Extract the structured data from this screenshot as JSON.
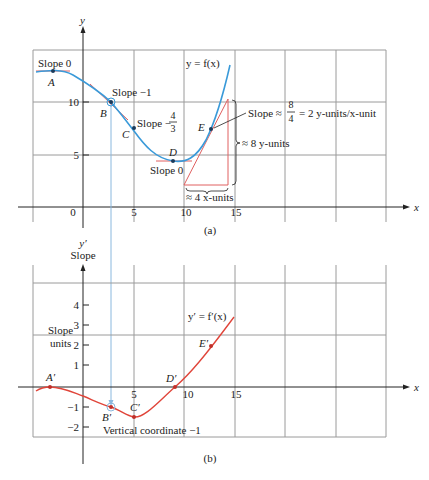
{
  "figure_a": {
    "caption": "(a)",
    "y_axis_label": "y",
    "x_axis_label": "x",
    "curve_label": "y = f(x)",
    "x_ticks": [
      "0",
      "5",
      "10",
      "15"
    ],
    "y_ticks": [
      "10",
      "5"
    ],
    "points": [
      {
        "name": "A",
        "slope_label": "Slope 0"
      },
      {
        "name": "B",
        "slope_label": "Slope −1"
      },
      {
        "name": "C",
        "slope_label": "Slope −",
        "fraction_num": "4",
        "fraction_den": "3"
      },
      {
        "name": "D",
        "slope_label": "Slope 0"
      },
      {
        "name": "E",
        "slope_label": "Slope ≈",
        "fraction_num": "8",
        "fraction_den": "4",
        "slope_suffix": "= 2 y-units/x-unit"
      }
    ],
    "rise_label": "≈ 8 y-units",
    "run_label": "≈ 4 x-units"
  },
  "figure_b": {
    "caption": "(b)",
    "y_axis_label": "y′",
    "y_axis_sublabel": "Slope",
    "x_axis_label": "x",
    "curve_label": "y′ = f′(x)",
    "units_label_1": "Slope",
    "units_label_2": "units",
    "x_ticks": [
      "5",
      "10",
      "15"
    ],
    "y_ticks": [
      "4",
      "3",
      "2",
      "1",
      "−1",
      "−2"
    ],
    "points": [
      {
        "name": "A′"
      },
      {
        "name": "B′"
      },
      {
        "name": "C′"
      },
      {
        "name": "D′"
      },
      {
        "name": "E′"
      }
    ],
    "annotation": "Vertical coordinate −1"
  },
  "colors": {
    "curve_f": "#3a9ad9",
    "curve_fprime": "#e0453a",
    "tangent": "#e06060",
    "grid": "#999999",
    "axis": "#222222",
    "point_dark": "#1a3a5a"
  }
}
